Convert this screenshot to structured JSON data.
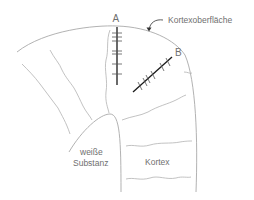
{
  "diagram": {
    "type": "cortex cross-section with recording electrodes",
    "labels": {
      "electrode_a": "A",
      "electrode_b": "B",
      "cortex_surface": "Kortexoberfläche",
      "white_matter_line1": "weiße",
      "white_matter_line2": "Substanz",
      "cortex": "Kortex"
    },
    "colors": {
      "outline": "#a9a9a9",
      "electrode": "#1a1a1a",
      "text": "#6f6f6f"
    }
  }
}
